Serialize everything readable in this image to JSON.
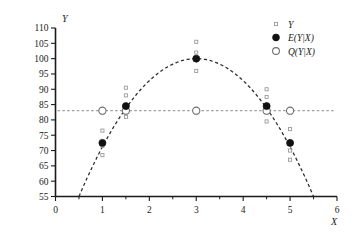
{
  "chart_data": {
    "type": "scatter",
    "title": "",
    "xlabel": "X",
    "ylabel": "Y",
    "xlim": [
      0,
      6
    ],
    "ylim": [
      55,
      110
    ],
    "xticks": [
      0,
      1,
      2,
      3,
      4,
      5,
      6
    ],
    "xtick_labels": [
      "0",
      "1",
      "2",
      "3",
      "4",
      "5",
      "6"
    ],
    "xminor_ticks": [
      0.5,
      1.5,
      2.5,
      3.5,
      4.5,
      5.5
    ],
    "yticks": [
      55,
      60,
      65,
      70,
      75,
      80,
      85,
      90,
      95,
      100,
      105,
      110
    ],
    "ytick_labels": [
      "55",
      "60",
      "65",
      "70",
      "75",
      "80",
      "85",
      "90",
      "95",
      "100",
      "105",
      "110"
    ],
    "grid": false,
    "legend_position": "top-right",
    "series": [
      {
        "name": "Y",
        "marker": "open-square",
        "x": [
          1,
          1,
          1,
          1.5,
          1.5,
          1.5,
          3,
          3,
          3,
          4.5,
          4.5,
          4.5,
          5,
          5,
          5
        ],
        "values": [
          76.5,
          71.5,
          68.5,
          90.5,
          88.0,
          81.0,
          105.5,
          102.0,
          96.0,
          90.0,
          87.5,
          79.5,
          77.0,
          70.0,
          67.0
        ]
      },
      {
        "name": "E(Y|X)",
        "marker": "filled-circle",
        "x": [
          1,
          1.5,
          3,
          4.5,
          5
        ],
        "values": [
          72.5,
          84.5,
          100.0,
          84.5,
          72.5
        ]
      },
      {
        "name": "Q(Y|X)",
        "marker": "open-circle",
        "x": [
          1,
          1.5,
          3,
          4.5,
          5
        ],
        "values": [
          83.0,
          83.0,
          83.0,
          83.0,
          83.0
        ]
      }
    ],
    "curves": [
      {
        "name": "conditional-mean-curve",
        "style": "dashed",
        "type": "parabola",
        "vertex": [
          3,
          100
        ],
        "x_intercepts_at_ylim_min": [
          0.5,
          5.5
        ]
      },
      {
        "name": "quantile-reference-line",
        "style": "dashed",
        "type": "horizontal",
        "y": 83.0
      }
    ],
    "legend": [
      {
        "label": "Y",
        "marker": "open-square"
      },
      {
        "label": "E(Y|X)",
        "marker": "filled-circle"
      },
      {
        "label": "Q(Y|X)",
        "marker": "open-circle"
      }
    ]
  }
}
